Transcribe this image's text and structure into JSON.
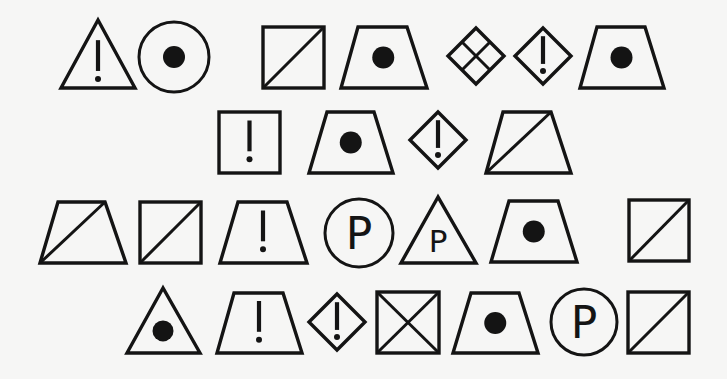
{
  "page": {
    "background": "#f6f6f5",
    "stroke_color": "#141414",
    "glyph_letter": "P"
  },
  "rows": [
    {
      "name": "row-1",
      "symbols": [
        {
          "type": "triangle",
          "mark": "exclamation",
          "apex": [
            98,
            20
          ],
          "base_left": [
            61,
            88
          ],
          "base_right": [
            135,
            88
          ]
        },
        {
          "type": "circle",
          "mark": "dot",
          "center": [
            174,
            57
          ],
          "r": 35
        },
        {
          "type": "square",
          "mark": "diagonal",
          "x": 263,
          "y": 27,
          "w": 61,
          "h": 61
        },
        {
          "type": "trapezoid",
          "mark": "dot",
          "top": [
            358,
            407
          ],
          "bottom": [
            341,
            427
          ],
          "y1": 27,
          "y2": 88
        },
        {
          "type": "diamond",
          "mark": "grid",
          "center": [
            476,
            56
          ],
          "half": 28
        },
        {
          "type": "diamond",
          "mark": "exclamation",
          "center": [
            543,
            56
          ],
          "half": 28
        },
        {
          "type": "trapezoid",
          "mark": "dot",
          "top": [
            597,
            645
          ],
          "bottom": [
            580,
            664
          ],
          "y1": 27,
          "y2": 88
        }
      ]
    },
    {
      "name": "row-2",
      "symbols": [
        {
          "type": "square",
          "mark": "exclamation",
          "x": 219,
          "y": 112,
          "w": 61,
          "h": 61
        },
        {
          "type": "trapezoid",
          "mark": "dot",
          "top": [
            327,
            374
          ],
          "bottom": [
            309,
            393
          ],
          "y1": 112,
          "y2": 173
        },
        {
          "type": "diamond",
          "mark": "exclamation",
          "center": [
            438,
            140
          ],
          "half": 28
        },
        {
          "type": "trapezoid",
          "mark": "diagonal",
          "top": [
            503,
            551
          ],
          "bottom": [
            486,
            571
          ],
          "y1": 112,
          "y2": 173
        }
      ]
    },
    {
      "name": "row-3",
      "symbols": [
        {
          "type": "trapezoid",
          "mark": "diagonal",
          "top": [
            58,
            105
          ],
          "bottom": [
            40,
            126
          ],
          "y1": 202,
          "y2": 263
        },
        {
          "type": "square",
          "mark": "diagonal",
          "x": 140,
          "y": 202,
          "w": 61,
          "h": 61
        },
        {
          "type": "trapezoid",
          "mark": "exclamation",
          "top": [
            238,
            287
          ],
          "bottom": [
            220,
            307
          ],
          "y1": 202,
          "y2": 263
        },
        {
          "type": "circle",
          "mark": "letter-p",
          "center": [
            359,
            233
          ],
          "r": 34
        },
        {
          "type": "triangle",
          "mark": "letter-p",
          "apex": [
            438,
            197
          ],
          "base_left": [
            401,
            263
          ],
          "base_right": [
            476,
            263
          ]
        },
        {
          "type": "trapezoid",
          "mark": "dot",
          "top": [
            509,
            558
          ],
          "bottom": [
            491,
            577
          ],
          "y1": 201,
          "y2": 262
        },
        {
          "type": "square",
          "mark": "diagonal",
          "x": 629,
          "y": 200,
          "w": 60,
          "h": 61
        }
      ]
    },
    {
      "name": "row-4",
      "symbols": [
        {
          "type": "triangle",
          "mark": "dot",
          "apex": [
            163,
            288
          ],
          "base_left": [
            127,
            353
          ],
          "base_right": [
            200,
            353
          ]
        },
        {
          "type": "trapezoid",
          "mark": "exclamation",
          "top": [
            234,
            283
          ],
          "bottom": [
            217,
            302
          ],
          "y1": 293,
          "y2": 353
        },
        {
          "type": "diamond",
          "mark": "exclamation",
          "center": [
            337,
            322
          ],
          "half": 28
        },
        {
          "type": "square",
          "mark": "cross",
          "x": 377,
          "y": 292,
          "w": 62,
          "h": 61
        },
        {
          "type": "trapezoid",
          "mark": "dot",
          "top": [
            471,
            519
          ],
          "bottom": [
            453,
            538
          ],
          "y1": 293,
          "y2": 353
        },
        {
          "type": "circle",
          "mark": "letter-p",
          "center": [
            584,
            322
          ],
          "r": 33
        },
        {
          "type": "square",
          "mark": "diagonal",
          "x": 628,
          "y": 292,
          "w": 61,
          "h": 61
        }
      ]
    }
  ]
}
